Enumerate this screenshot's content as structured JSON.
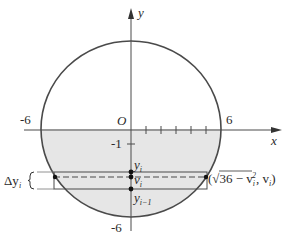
{
  "diagram": {
    "type": "circle-region-slice",
    "axes": {
      "x_label": "x",
      "y_label": "y",
      "origin_label": "O",
      "x_tick_labels": [
        "-6",
        "6"
      ],
      "y_tick_labels": [
        "-1",
        "-6"
      ]
    },
    "circle": {
      "radius": 6,
      "equation_hint": "x^2 + y^2 = 36"
    },
    "shaded_region": "part of disk below y = 0",
    "strip": {
      "delta_label": "Δy",
      "delta_sub": "i",
      "points": [
        {
          "label": "y",
          "sub": "i"
        },
        {
          "label": "v",
          "sub": "i"
        },
        {
          "label": "y",
          "sub": "i−1"
        }
      ],
      "endpoint_label_prefix": "(√36 − v",
      "endpoint_label_sub": "i",
      "endpoint_label_sup": "2",
      "endpoint_label_suffix": ", v",
      "endpoint_label_sub2": "i",
      "endpoint_label_close": ")"
    },
    "colors": {
      "stroke": "#4a4a4a",
      "fill": "#e6e6e6",
      "text": "#2a2a2a"
    }
  }
}
